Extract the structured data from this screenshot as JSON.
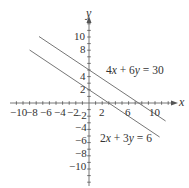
{
  "chart_data": {
    "type": "line",
    "title": "",
    "xlabel": "x",
    "ylabel": "y",
    "xlim": [
      -11.5,
      13
    ],
    "ylim": [
      -12.5,
      13
    ],
    "grid": false,
    "x_tick_labels": [
      "-10",
      "-8",
      "-6",
      "-4",
      "-2",
      "2",
      "6",
      "10"
    ],
    "y_tick_labels": [
      "10",
      "8",
      "4",
      "2",
      "-2",
      "-4",
      "-6",
      "-8",
      "-10"
    ],
    "series": [
      {
        "name": "4x + 6y = 30",
        "equation": "4x + 6y = 30",
        "slope": -0.6667,
        "y_intercept": 5,
        "x_intercept": 7.5,
        "x": [
          -7.6,
          11.6
        ],
        "y": [
          10.07,
          -2.73
        ]
      },
      {
        "name": "2x + 3y = 6",
        "equation": "2x + 3y = 6",
        "slope": -0.6667,
        "y_intercept": 2,
        "x_intercept": 3,
        "x": [
          -9,
          10.7
        ],
        "y": [
          8,
          -5.13
        ]
      }
    ],
    "annotations": [
      {
        "text": "4x + 6y = 30",
        "x": 3,
        "y": 6
      },
      {
        "text": "2x + 3y = 6",
        "x": 3,
        "y": -5
      }
    ]
  },
  "labels": {
    "x_axis": "x",
    "y_axis": "y",
    "eq1_coef_x": "4",
    "eq1_var_x": "x",
    "eq1_mid": " + 6",
    "eq1_var_y": "y",
    "eq1_rhs": " = 30",
    "eq2_coef_x": "2",
    "eq2_var_x": "x",
    "eq2_mid": " + 3",
    "eq2_var_y": "y",
    "eq2_rhs": " = 6",
    "xt_m10": "−10",
    "xt_m8": "−8",
    "xt_m6": "−6",
    "xt_m4": "−4",
    "xt_m2": "−2",
    "xt_2": "2",
    "xt_6": "6",
    "xt_10": "10",
    "yt_10": "10",
    "yt_8": "8",
    "yt_4": "4",
    "yt_2": "2",
    "yt_m2": "−2",
    "yt_m4": "−4",
    "yt_m6": "−6",
    "yt_m8": "−8",
    "yt_m10": "−10"
  },
  "colors": {
    "axis": "#555555",
    "line": "#555555",
    "text": "#333333"
  }
}
